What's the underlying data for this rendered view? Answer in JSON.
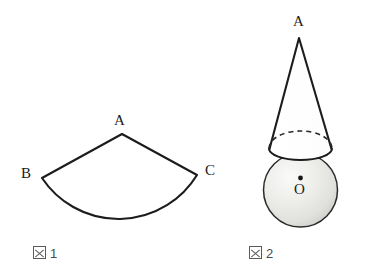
{
  "figure1": {
    "caption_kanji": "図",
    "caption_number": "1",
    "labels": {
      "apex": "A",
      "arc_start": "B",
      "arc_end": "C"
    }
  },
  "figure2": {
    "caption_kanji": "図",
    "caption_number": "2",
    "labels": {
      "apex": "A",
      "center": "O"
    }
  },
  "colors": {
    "stroke": "#1c1c1c",
    "background": "#ffffff",
    "sphere_light": "#f2f2f0",
    "sphere_mid": "#e3e3e0",
    "sphere_shadow": "#cfcfcb",
    "caption": "#4a4a4a"
  }
}
